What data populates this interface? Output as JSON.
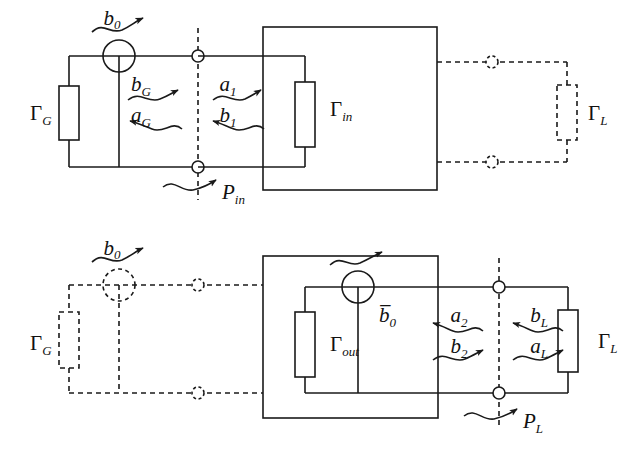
{
  "figure": {
    "background_color": "#ffffff",
    "line_color": "#1a1a1a",
    "solid_style": "solid",
    "dashed_style": "dashed"
  },
  "diagrams": [
    {
      "id": "top",
      "name": "input-side-diagram",
      "description": "Generator on the left (solid), two-port network box with Gamma_in, dashed load network on the right",
      "left_network": {
        "style": "solid",
        "source_label": "b_0",
        "source_symbol": "circle-source",
        "impedance_label": "Γ_G",
        "impedance_base": "Γ",
        "impedance_sub": "G"
      },
      "box": {
        "style": "solid",
        "impedance_label": "Γ_in",
        "impedance_base": "Γ",
        "impedance_sub": "in"
      },
      "right_network": {
        "style": "dashed",
        "impedance_label": "Γ_L",
        "impedance_base": "Γ",
        "impedance_sub": "L"
      },
      "reference_plane": {
        "style": "dashed",
        "power_label": "P_in",
        "power_base": "P",
        "power_sub": "in"
      },
      "waves": [
        {
          "name": "b_G",
          "base": "b",
          "sub": "G",
          "direction": "right",
          "side": "left"
        },
        {
          "name": "a_G",
          "base": "a",
          "sub": "G",
          "direction": "left",
          "side": "left"
        },
        {
          "name": "a_1",
          "base": "a",
          "sub": "1",
          "direction": "right",
          "side": "right"
        },
        {
          "name": "b_1",
          "base": "b",
          "sub": "1",
          "direction": "left",
          "side": "right"
        }
      ]
    },
    {
      "id": "bottom",
      "name": "output-side-diagram",
      "description": "Dashed generator on the left, two-port box with Gamma_out and internal source b-bar_0, solid load on the right",
      "left_network": {
        "style": "dashed",
        "source_label": "b_0",
        "source_symbol": "circle-source",
        "impedance_label": "Γ_G",
        "impedance_base": "Γ",
        "impedance_sub": "G"
      },
      "box": {
        "style": "solid",
        "impedance_label": "Γ_out",
        "impedance_base": "Γ",
        "impedance_sub": "out",
        "source_label": "b̄_0",
        "source_base": "b",
        "source_sub": "0",
        "source_overbar": true,
        "source_symbol": "circle-source"
      },
      "right_network": {
        "style": "solid",
        "impedance_label": "Γ_L",
        "impedance_base": "Γ",
        "impedance_sub": "L"
      },
      "reference_plane": {
        "style": "dashed",
        "power_label": "P_L",
        "power_base": "P",
        "power_sub": "L"
      },
      "waves": [
        {
          "name": "a_2",
          "base": "a",
          "sub": "2",
          "direction": "left",
          "side": "left"
        },
        {
          "name": "b_2",
          "base": "b",
          "sub": "2",
          "direction": "right",
          "side": "left"
        },
        {
          "name": "b_L",
          "base": "b",
          "sub": "L",
          "direction": "left",
          "side": "right"
        },
        {
          "name": "a_L",
          "base": "a",
          "sub": "L",
          "direction": "right",
          "side": "right"
        }
      ]
    }
  ]
}
